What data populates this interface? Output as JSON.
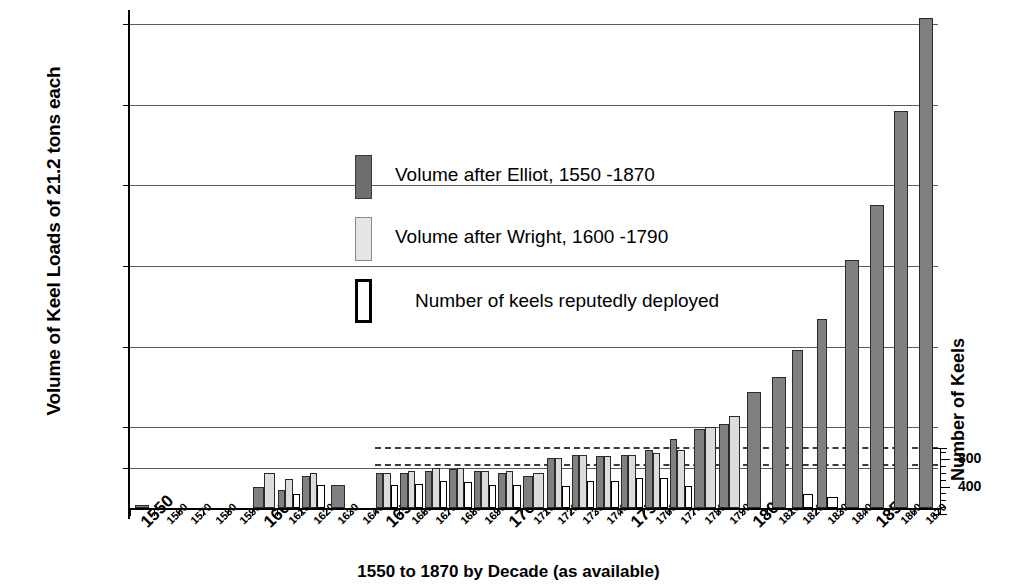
{
  "chart_data": {
    "type": "bar",
    "title": "",
    "xlabel": "1550 to 1870 by Decade (as available)",
    "ylabel": "Volume of Keel Loads of 21.2 tons each",
    "y2label": "Number of Keels",
    "ylim": [
      0,
      312000
    ],
    "y2lim": [
      0,
      960
    ],
    "grid": true,
    "legend_position": "inside-upper-left",
    "ytick_labels": [
      "25,000",
      "50,000",
      "100,000",
      "150,000",
      "200,000",
      "250,000",
      "300,000"
    ],
    "ytick_values": [
      25000,
      50000,
      100000,
      150000,
      200000,
      250000,
      300000
    ],
    "y2tick_labels": [
      "400",
      "800"
    ],
    "y2tick_values": [
      400,
      800
    ],
    "categories": [
      "1550",
      "1560",
      "1570",
      "1580",
      "1590",
      "1600",
      "1610",
      "1620",
      "1630",
      "1640",
      "1650",
      "1660",
      "1670",
      "1680",
      "1690",
      "1700",
      "1710",
      "1720",
      "1730",
      "1740",
      "1750",
      "1760",
      "1770",
      "1780",
      "1790",
      "1800",
      "1810",
      "1820",
      "1830",
      "1840",
      "1850",
      "1860",
      "1870"
    ],
    "major_categories": [
      "1550",
      "1600",
      "1650",
      "1700",
      "1750",
      "1800",
      "1850"
    ],
    "series": [
      {
        "name": "Volume after Elliot, 1550 -1870",
        "color": "#808080",
        "axis": "left",
        "values": [
          2000,
          null,
          null,
          null,
          null,
          13000,
          11000,
          20000,
          14000,
          null,
          22000,
          22000,
          23000,
          24000,
          23000,
          22000,
          20000,
          31000,
          33000,
          32000,
          33000,
          36000,
          43000,
          49000,
          52000,
          72000,
          81000,
          98000,
          117000,
          154000,
          188000,
          246000,
          304000
        ]
      },
      {
        "name": "Volume after Wright, 1600 -1790",
        "color": "#dcdcdc",
        "axis": "left",
        "values": [
          null,
          null,
          null,
          null,
          null,
          22000,
          18000,
          22000,
          null,
          null,
          22000,
          23000,
          25000,
          25000,
          23000,
          23000,
          22000,
          31000,
          33000,
          32000,
          33000,
          34000,
          36000,
          50000,
          57000,
          null,
          null,
          null,
          null,
          null,
          null,
          null,
          null
        ]
      },
      {
        "name": "Number of keels reputedly deployed",
        "color": "#ffffff",
        "axis": "right",
        "values": [
          null,
          null,
          null,
          null,
          null,
          null,
          200,
          330,
          null,
          null,
          330,
          350,
          400,
          380,
          330,
          330,
          null,
          320,
          400,
          390,
          430,
          430,
          320,
          null,
          null,
          null,
          null,
          200,
          160,
          null,
          null,
          null,
          null
        ]
      }
    ],
    "reference_lines": [
      {
        "value": 38000,
        "style": "dashed",
        "from_category": "1650",
        "to_category": "1870"
      },
      {
        "value": 27000,
        "style": "dashed",
        "from_category": "1650",
        "to_category": "1870"
      }
    ]
  },
  "legend": {
    "items": [
      {
        "label": "Volume after Elliot, 1550 -1870",
        "swatch": "elliot"
      },
      {
        "label": "Volume after Wright, 1600 -1790",
        "swatch": "wright"
      },
      {
        "label": "Number of keels reputedly deployed",
        "swatch": "keels"
      }
    ]
  }
}
